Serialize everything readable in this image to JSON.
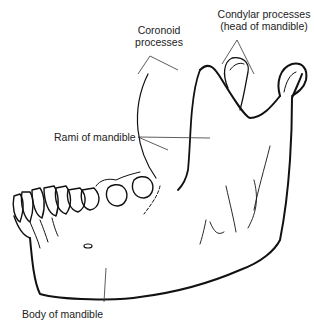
{
  "diagram": {
    "labels": {
      "condylar_line1": "Condylar processes",
      "condylar_line2": "(head of mandible)",
      "coronoid_line1": "Coronoid",
      "coronoid_line2": "processes",
      "rami": "Rami of mandible",
      "body": "Body of mandible"
    },
    "colors": {
      "outline": "#111111",
      "leader": "#333333",
      "text": "#222222",
      "background": "#ffffff"
    }
  }
}
